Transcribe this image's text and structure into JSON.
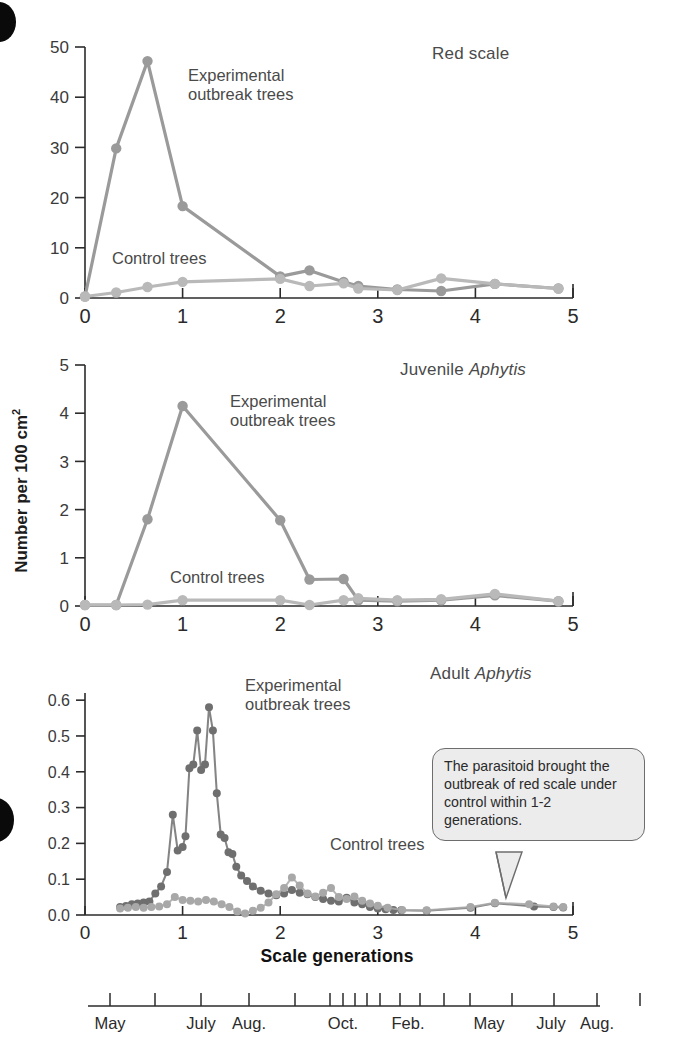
{
  "figure": {
    "y_axis_label": "Number per 100 cm",
    "y_axis_label_sup": "2",
    "x_axis_label": "Scale generations",
    "series_label_experimental_line1": "Experimental",
    "series_label_experimental_line2": "outbreak trees",
    "series_label_control": "Control trees",
    "colors": {
      "experimental_panel12": "#9a9a9a",
      "control_panel12": "#b9b9b9",
      "experimental_panel3": "#6f6f6f",
      "control_panel3": "#a8a8a8",
      "axis": "#2b2b2b",
      "text": "#4a4a4a",
      "callout_fill": "#ececec",
      "callout_border": "#6d6d6d"
    }
  },
  "callout": {
    "text": "The parasitoid brought the outbreak of red scale under control within 1-2 generations."
  },
  "month_axis": {
    "labels": [
      {
        "text": "May",
        "x": 110
      },
      {
        "text": "July",
        "x": 201
      },
      {
        "text": "Aug.",
        "x": 249
      },
      {
        "text": "Oct.",
        "x": 343
      },
      {
        "text": "Feb.",
        "x": 408
      },
      {
        "text": "May",
        "x": 489
      },
      {
        "text": "July",
        "x": 551
      },
      {
        "text": "Aug.",
        "x": 597
      }
    ],
    "tick_x": [
      110,
      155,
      201,
      249,
      295,
      330,
      343,
      355,
      367,
      380,
      400,
      420,
      444,
      470,
      512,
      554,
      597,
      640
    ]
  },
  "chart_data": [
    {
      "type": "line",
      "panel": "red-scale",
      "title": "Red scale",
      "title_italic_part": "",
      "xlabel": "Scale generations",
      "ylabel": "Number per 100 cm2",
      "xlim": [
        0,
        5
      ],
      "ylim": [
        0,
        50
      ],
      "xticks": [
        0,
        1,
        2,
        3,
        4,
        5
      ],
      "yticks": [
        0,
        10,
        20,
        30,
        40,
        50
      ],
      "grid": false,
      "series": [
        {
          "name": "Experimental outbreak trees",
          "color": "#9a9a9a",
          "x": [
            0,
            0.32,
            0.64,
            1.0,
            2.0,
            2.3,
            2.65,
            2.8,
            3.2,
            3.65,
            4.2,
            4.85
          ],
          "y": [
            0.3,
            29.8,
            47.2,
            18.3,
            4.3,
            5.5,
            3.2,
            2.4,
            1.7,
            1.4,
            2.8,
            1.9
          ]
        },
        {
          "name": "Control trees",
          "color": "#b9b9b9",
          "x": [
            0,
            0.32,
            0.64,
            1.0,
            2.0,
            2.3,
            2.65,
            2.8,
            3.2,
            3.65,
            4.2,
            4.85
          ],
          "y": [
            0.3,
            1.1,
            2.2,
            3.2,
            3.8,
            2.4,
            2.9,
            1.9,
            1.6,
            3.9,
            2.8,
            1.9
          ]
        }
      ]
    },
    {
      "type": "line",
      "panel": "juvenile-aphytis",
      "title": "Juvenile ",
      "title_italic_part": "Aphytis",
      "xlabel": "Scale generations",
      "ylabel": "Number per 100 cm2",
      "xlim": [
        0,
        5
      ],
      "ylim": [
        0,
        5
      ],
      "xticks": [
        0,
        1,
        2,
        3,
        4,
        5
      ],
      "yticks": [
        0,
        1,
        2,
        3,
        4,
        5
      ],
      "grid": false,
      "series": [
        {
          "name": "Experimental outbreak trees",
          "color": "#9a9a9a",
          "x": [
            0,
            0.32,
            0.64,
            1.0,
            2.0,
            2.3,
            2.65,
            2.8,
            3.2,
            3.65,
            4.2,
            4.85
          ],
          "y": [
            0.02,
            0.02,
            1.8,
            4.15,
            1.78,
            0.55,
            0.56,
            0.12,
            0.1,
            0.12,
            0.22,
            0.1
          ]
        },
        {
          "name": "Control trees",
          "color": "#b9b9b9",
          "x": [
            0,
            0.32,
            0.64,
            1.0,
            2.0,
            2.3,
            2.65,
            2.8,
            3.2,
            3.65,
            4.2,
            4.85
          ],
          "y": [
            0.02,
            0.02,
            0.03,
            0.12,
            0.12,
            0.02,
            0.12,
            0.16,
            0.12,
            0.14,
            0.25,
            0.1
          ]
        }
      ]
    },
    {
      "type": "scatter",
      "panel": "adult-aphytis",
      "title": "Adult ",
      "title_italic_part": "Aphytis",
      "xlabel": "Scale generations",
      "ylabel": "Number per 100 cm2",
      "xlim": [
        0,
        5
      ],
      "ylim": [
        0,
        0.62
      ],
      "xticks": [
        0,
        1,
        2,
        3,
        4,
        5
      ],
      "yticks": [
        0.0,
        0.1,
        0.2,
        0.3,
        0.4,
        0.5,
        0.6
      ],
      "ytick_labels": [
        "0.0",
        "0.1",
        "0.2",
        "0.3",
        "0.4",
        "0.5",
        "0.6"
      ],
      "grid": false,
      "series": [
        {
          "name": "Experimental outbreak trees",
          "color": "#6f6f6f",
          "x": [
            0.36,
            0.42,
            0.48,
            0.54,
            0.6,
            0.66,
            0.72,
            0.78,
            0.84,
            0.9,
            0.95,
            1.0,
            1.03,
            1.07,
            1.11,
            1.15,
            1.19,
            1.23,
            1.27,
            1.31,
            1.35,
            1.39,
            1.43,
            1.47,
            1.51,
            1.55,
            1.6,
            1.66,
            1.72,
            1.8,
            1.88,
            1.96,
            2.04,
            2.12,
            2.2,
            2.28,
            2.36,
            2.44,
            2.52,
            2.6,
            2.68,
            2.76,
            2.84,
            2.92,
            3.0,
            3.08,
            3.16,
            3.24,
            3.5,
            3.95,
            4.2,
            4.6,
            4.8,
            4.9
          ],
          "y": [
            0.022,
            0.025,
            0.03,
            0.032,
            0.035,
            0.038,
            0.06,
            0.08,
            0.12,
            0.28,
            0.18,
            0.19,
            0.22,
            0.41,
            0.42,
            0.515,
            0.405,
            0.42,
            0.58,
            0.515,
            0.34,
            0.225,
            0.215,
            0.175,
            0.17,
            0.135,
            0.11,
            0.095,
            0.08,
            0.068,
            0.06,
            0.055,
            0.06,
            0.07,
            0.062,
            0.058,
            0.05,
            0.045,
            0.04,
            0.038,
            0.048,
            0.035,
            0.03,
            0.022,
            0.018,
            0.016,
            0.014,
            0.013,
            0.012,
            0.02,
            0.033,
            0.024,
            0.022,
            0.021
          ]
        },
        {
          "name": "Control trees",
          "color": "#a8a8a8",
          "x": [
            0.36,
            0.44,
            0.52,
            0.6,
            0.68,
            0.76,
            0.84,
            0.92,
            1.0,
            1.08,
            1.16,
            1.24,
            1.32,
            1.4,
            1.48,
            1.56,
            1.64,
            1.72,
            1.8,
            1.88,
            1.96,
            2.04,
            2.12,
            2.2,
            2.28,
            2.36,
            2.44,
            2.52,
            2.6,
            2.68,
            2.76,
            2.84,
            2.92,
            3.0,
            3.1,
            3.25,
            3.5,
            3.95,
            4.2,
            4.55,
            4.8,
            4.9
          ],
          "y": [
            0.018,
            0.02,
            0.022,
            0.02,
            0.022,
            0.024,
            0.03,
            0.05,
            0.042,
            0.04,
            0.038,
            0.042,
            0.038,
            0.03,
            0.022,
            0.01,
            0.004,
            0.012,
            0.02,
            0.035,
            0.058,
            0.075,
            0.105,
            0.082,
            0.06,
            0.052,
            0.062,
            0.075,
            0.05,
            0.045,
            0.052,
            0.04,
            0.032,
            0.026,
            0.02,
            0.014,
            0.013,
            0.022,
            0.034,
            0.03,
            0.024,
            0.022
          ]
        }
      ]
    }
  ]
}
